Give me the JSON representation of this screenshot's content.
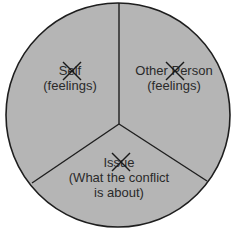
{
  "diagram": {
    "type": "three-sector-circle",
    "colors": {
      "fill": "#b5b5b5",
      "outline": "#1e1e1e",
      "divider": "#1e1e1e",
      "text": "#2a2a2a",
      "cross": "#1a1a1a"
    },
    "sectors": [
      {
        "id": "self",
        "title_prefix": "S",
        "title_crossed": "el",
        "title_suffix": "f",
        "title_full": "Self",
        "subtitle": "(feelings)",
        "crossed_out": true
      },
      {
        "id": "other-person",
        "title_prefix": "Other ",
        "title_crossed": "P",
        "title_suffix": "erson",
        "title_full": "Other Person",
        "subtitle": "(feelings)",
        "crossed_out": true
      },
      {
        "id": "issue",
        "title_prefix": "Is",
        "title_crossed": "su",
        "title_suffix": "e",
        "title_full": "Issue",
        "subtitle_line1": "(What the conflict",
        "subtitle_line2": "is about)",
        "crossed_out": true
      }
    ]
  }
}
